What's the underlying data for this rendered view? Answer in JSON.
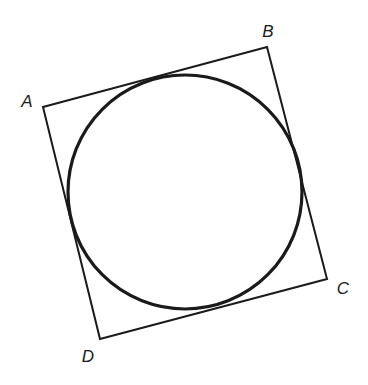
{
  "diagram": {
    "square": {
      "vertices": [
        {
          "name": "A",
          "x": 43,
          "y": 107
        },
        {
          "name": "B",
          "x": 267,
          "y": 47
        },
        {
          "name": "C",
          "x": 327,
          "y": 279
        },
        {
          "name": "D",
          "x": 100,
          "y": 339
        }
      ],
      "stroke": "#1a1a1a",
      "stroke_width": 2
    },
    "circle": {
      "cx": 185,
      "cy": 192,
      "r": 117,
      "stroke": "#1a1a1a",
      "stroke_width": 3.2
    },
    "labels": [
      {
        "text": "A",
        "x": 27,
        "y": 101
      },
      {
        "text": "B",
        "x": 268,
        "y": 31
      },
      {
        "text": "C",
        "x": 343,
        "y": 288
      },
      {
        "text": "D",
        "x": 88,
        "y": 356
      }
    ]
  }
}
